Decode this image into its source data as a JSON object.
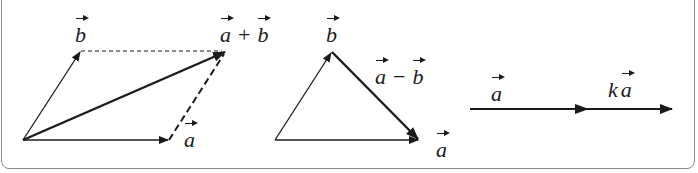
{
  "figures": {
    "sum": {
      "label_b": "b",
      "label_a": "a",
      "label_sum": {
        "left": "a",
        "op": "+",
        "right": "b"
      }
    },
    "difference": {
      "label_b": "b",
      "label_a": "a",
      "label_diff": {
        "left": "a",
        "op": "−",
        "right": "b"
      }
    },
    "scalar": {
      "label_a": "a",
      "label_k": "k",
      "label_ka": "a"
    }
  },
  "colors": {
    "stroke": "#1a1a1a",
    "frame": "#8a8a8a"
  }
}
